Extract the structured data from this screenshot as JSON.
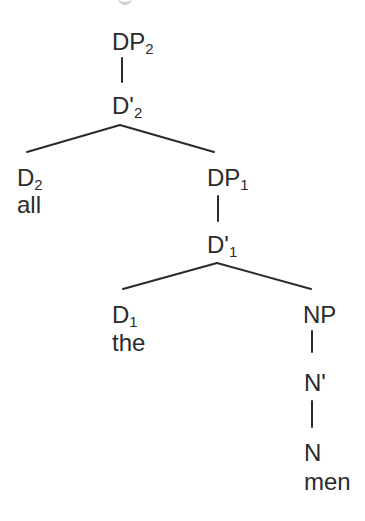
{
  "diagram": {
    "type": "syntax-tree",
    "nodes": {
      "dp2": {
        "base": "DP",
        "sub": "2"
      },
      "dbar2": {
        "base": "D'",
        "sub": "2"
      },
      "d2": {
        "base": "D",
        "sub": "2",
        "word": "all"
      },
      "dp1": {
        "base": "DP",
        "sub": "1"
      },
      "dbar1": {
        "base": "D'",
        "sub": "1"
      },
      "d1": {
        "base": "D",
        "sub": "1",
        "word": "the"
      },
      "np": {
        "base": "NP"
      },
      "nbar": {
        "base": "N'"
      },
      "n": {
        "base": "N",
        "word": "men"
      }
    },
    "edges": [
      [
        "DP2",
        "D'2"
      ],
      [
        "D'2",
        "D2"
      ],
      [
        "D'2",
        "DP1"
      ],
      [
        "DP1",
        "D'1"
      ],
      [
        "D'1",
        "D1"
      ],
      [
        "D'1",
        "NP"
      ],
      [
        "NP",
        "N'"
      ],
      [
        "N'",
        "N"
      ]
    ],
    "colors": {
      "ink": "#2b2b2b",
      "background": "#ffffff"
    }
  }
}
